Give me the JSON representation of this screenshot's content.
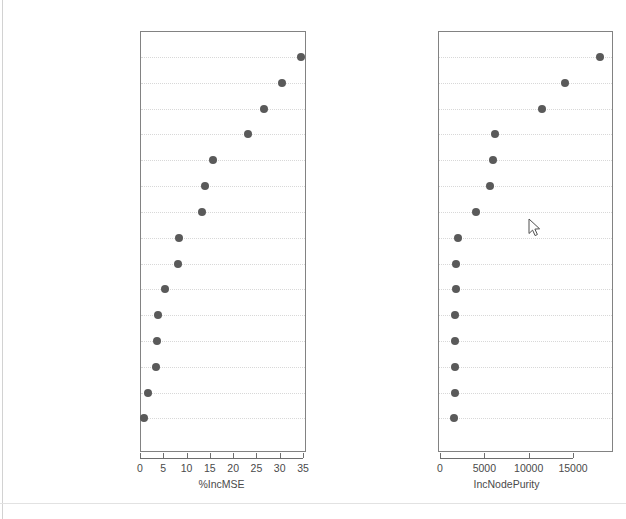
{
  "figure": {
    "title": "",
    "cursor": {
      "x": 529,
      "y": 219,
      "icon": "mouse-pointer-icon"
    }
  },
  "chart_data": [
    {
      "type": "scatter",
      "panel": "left",
      "title": "",
      "xlabel": "%IncMSE",
      "ylabel": "",
      "xlim": [
        -0.6,
        35.6
      ],
      "xticks": [
        0,
        5,
        10,
        15,
        20,
        25,
        30,
        35
      ],
      "xticklabels": [
        "0",
        "5",
        "10",
        "15",
        "20",
        "25",
        "30",
        "35"
      ],
      "grid": true,
      "grid_orientation": "horizontal",
      "legend": "none",
      "categories": [
        "phonesper1000",
        "birthrate",
        "regionid",
        "Infantdeathsper1k",
        "infdeaths",
        "gdppercapitalindollars",
        "deathrate",
        "netmigration",
        "otherpct",
        "arablepct",
        "poppersqmile",
        "cropspct",
        "population",
        "coast_arearatio",
        "areasqmiles"
      ],
      "values": [
        34.6,
        30.5,
        26.6,
        23.1,
        15.6,
        13.9,
        13.4,
        8.4,
        8.2,
        5.4,
        3.9,
        3.7,
        3.4,
        1.7,
        0.9
      ]
    },
    {
      "type": "scatter",
      "panel": "right",
      "title": "",
      "xlabel": "IncNodePurity",
      "ylabel": "",
      "xlim": [
        -200,
        19600
      ],
      "xticks": [
        0,
        5000,
        10000,
        15000
      ],
      "xticklabels": [
        "0",
        "5000",
        "10000",
        "15000"
      ],
      "grid": true,
      "grid_orientation": "horizontal",
      "legend": "none",
      "categories": [
        "phonesper1000",
        "birthrate",
        "Infantdeathsper1k",
        "gdppercapitalindollars",
        "regionid",
        "infdeaths",
        "deathrate",
        "cropspct",
        "population",
        "coast_arearatio",
        "netmigration",
        "areasqmiles",
        "poppersqmile",
        "arablepct",
        "otherpct"
      ],
      "values": [
        18000,
        14150,
        11550,
        6250,
        6000,
        5650,
        4100,
        2050,
        1850,
        1750,
        1700,
        1700,
        1700,
        1650,
        1600
      ]
    }
  ]
}
